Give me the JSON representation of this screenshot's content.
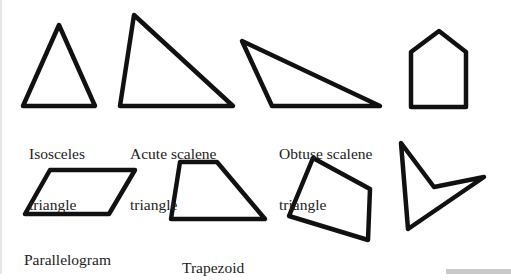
{
  "figure": {
    "stroke_color": "#111111",
    "background": "#ffffff",
    "shapes": [
      {
        "id": "isosceles",
        "label_line1": "Isosceles",
        "label_line2": "triangle",
        "points": "59,25 95,106 23,106"
      },
      {
        "id": "acute-scalene",
        "label_line1": "Acute scalene",
        "label_line2": "triangle",
        "points": "134,15 233,106 120,106"
      },
      {
        "id": "obtuse-scalene",
        "label_line1": "Obtuse scalene",
        "label_line2": "triangle",
        "points": "242,41 380,106 272,106"
      },
      {
        "id": "pentagon-house",
        "label_line1": "",
        "label_line2": "",
        "points": "411,52 439,31 466,52 466,107 411,107"
      },
      {
        "id": "parallelogram",
        "label_line1": "Parallelogram",
        "label_line2": "",
        "points": "50,170 135,170 109,214 25,214"
      },
      {
        "id": "trapezoid",
        "label_line1": "Trapezoid",
        "label_line2": "",
        "points": "180,162 217,162 265,219 171,219"
      },
      {
        "id": "irregular-quadrilateral",
        "label_line1": "",
        "label_line2": "",
        "points": "313,158 370,189 368,240 289,216"
      },
      {
        "id": "concave-quadrilateral",
        "label_line1": "",
        "label_line2": "",
        "points": "401,143 434,187 484,177 408,229"
      }
    ]
  }
}
